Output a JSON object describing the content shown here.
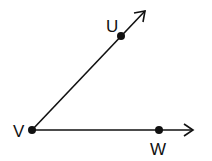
{
  "diagram": {
    "type": "angle",
    "points": [
      {
        "name": "U",
        "x": 121,
        "y": 36,
        "label": "U",
        "label_x": 106,
        "label_y": 32
      },
      {
        "name": "V",
        "x": 32,
        "y": 130,
        "label": "V",
        "label_x": 13,
        "label_y": 137
      },
      {
        "name": "W",
        "x": 159,
        "y": 130,
        "label": "W",
        "label_x": 150,
        "label_y": 155
      }
    ],
    "rays": [
      {
        "from": "V",
        "through": "U",
        "end_x": 145,
        "end_y": 11
      },
      {
        "from": "V",
        "through": "W",
        "end_x": 193,
        "end_y": 130
      }
    ],
    "colors": {
      "stroke": "#111111",
      "background": "#ffffff"
    }
  }
}
